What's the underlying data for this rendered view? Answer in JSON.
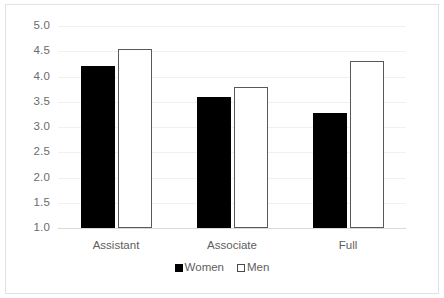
{
  "chart_data": {
    "type": "bar",
    "title": "",
    "subtitle": "",
    "xlabel": "",
    "ylabel": "",
    "categories": [
      "Assistant",
      "Associate",
      "Full"
    ],
    "series": [
      {
        "name": "Women",
        "values": [
          4.2,
          3.6,
          3.27
        ],
        "color": "#000000",
        "style": "filled"
      },
      {
        "name": "Men",
        "values": [
          4.55,
          3.8,
          4.3
        ],
        "color": "#ffffff",
        "style": "outlined"
      }
    ],
    "ylim": [
      1.0,
      5.0
    ],
    "ytick_labels": [
      "5.0",
      "4.5",
      "4.0",
      "3.5",
      "3.0",
      "2.5",
      "2.0",
      "1.5",
      "1.0"
    ],
    "ytick_values": [
      5.0,
      4.5,
      4.0,
      3.5,
      3.0,
      2.5,
      2.0,
      1.5,
      1.0
    ],
    "grid": true,
    "grid_color": "#f0f0f0",
    "axis_color": "#d9d9d9",
    "legend_position": "bottom",
    "legend_entries": [
      "Women",
      "Men"
    ],
    "background": "#ffffff",
    "text_color": "#5e5e5e"
  }
}
